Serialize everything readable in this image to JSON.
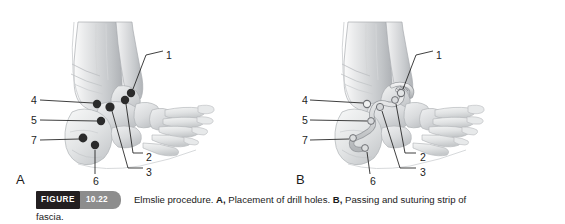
{
  "figure": {
    "badge_label": "FIGURE",
    "badge_number": "10.22",
    "caption_part1": "Elmslie procedure. ",
    "caption_bold_a": "A,",
    "caption_part2": " Placement of drill holes. ",
    "caption_bold_b": "B,",
    "caption_part3": " Passing and suturing strip of",
    "caption_part4": "fascia.",
    "colors": {
      "badge_dark": "#231f20",
      "badge_gray": "#8d8d8d",
      "drill_hole": "#2b2b2b",
      "leader_line": "#1d1d1d",
      "bone_light": "#e8e9ea",
      "bone_mid": "#cdcfd1",
      "bone_shadow": "#b3b6b9",
      "background": "#ffffff"
    }
  },
  "panels": [
    {
      "id": "panel-a",
      "letter": "A",
      "subtitle": "Placement of drill holes",
      "callouts": [
        {
          "number": "1",
          "x": 166,
          "y": 50
        },
        {
          "number": "2",
          "x": 146,
          "y": 152
        },
        {
          "number": "3",
          "x": 146,
          "y": 167
        },
        {
          "number": "4",
          "x": 31,
          "y": 95
        },
        {
          "number": "5",
          "x": 31,
          "y": 115
        },
        {
          "number": "7",
          "x": 31,
          "y": 135
        },
        {
          "number": "6",
          "x": 93,
          "y": 176
        }
      ],
      "drill_holes": [
        {
          "label": "1",
          "x": 131,
          "y": 93
        },
        {
          "label": "2",
          "x": 125,
          "y": 100
        },
        {
          "label": "3",
          "x": 110,
          "y": 107
        },
        {
          "label": "4",
          "x": 97,
          "y": 104
        },
        {
          "label": "5",
          "x": 101,
          "y": 121
        },
        {
          "label": "7",
          "x": 83,
          "y": 138
        },
        {
          "label": "6",
          "x": 95,
          "y": 145
        }
      ]
    },
    {
      "id": "panel-b",
      "letter": "B",
      "subtitle": "Passing and suturing strip of fascia",
      "callouts": [
        {
          "number": "1",
          "x": 436,
          "y": 50
        },
        {
          "number": "2",
          "x": 420,
          "y": 152
        },
        {
          "number": "3",
          "x": 420,
          "y": 167
        },
        {
          "number": "4",
          "x": 302,
          "y": 95
        },
        {
          "number": "5",
          "x": 302,
          "y": 115
        },
        {
          "number": "7",
          "x": 302,
          "y": 135
        },
        {
          "number": "6",
          "x": 370,
          "y": 176
        }
      ],
      "drill_holes": [
        {
          "label": "1",
          "x": 401,
          "y": 93
        },
        {
          "label": "2",
          "x": 395,
          "y": 100
        },
        {
          "label": "3",
          "x": 380,
          "y": 107
        },
        {
          "label": "4",
          "x": 367,
          "y": 104
        },
        {
          "label": "5",
          "x": 371,
          "y": 121
        },
        {
          "label": "7",
          "x": 353,
          "y": 138
        },
        {
          "label": "6",
          "x": 365,
          "y": 145
        }
      ]
    }
  ]
}
